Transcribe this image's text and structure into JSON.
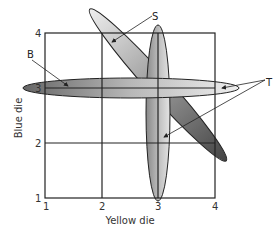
{
  "diagram": {
    "type": "dice-outcome-grid",
    "x_axis": {
      "label": "Yellow die",
      "ticks": [
        "1",
        "2",
        "3",
        "4"
      ]
    },
    "y_axis": {
      "label": "Blue die",
      "ticks": [
        "1",
        "2",
        "3",
        "4"
      ]
    },
    "grid_cells": "3x3",
    "regions": [
      {
        "id": "B",
        "label": "B",
        "description": "horizontal ellipse along Blue die = 3"
      },
      {
        "id": "S",
        "label": "S",
        "description": "diagonal ellipse from top-left to bottom-right"
      },
      {
        "id": "T",
        "label": "T",
        "description": "vertical ellipse along Yellow die = 3 and horizontal ellipse tip (two arrows)"
      }
    ],
    "colors": {
      "grid": "#222222",
      "ellipse_dark": "#555555",
      "ellipse_light": "#e0e0e0"
    }
  }
}
